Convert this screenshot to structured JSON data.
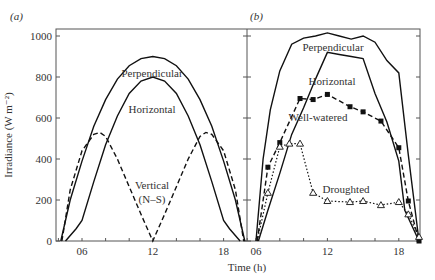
{
  "figure": {
    "ylabel": "Irradiance (W m⁻²)",
    "xlabel": "Time (h)",
    "yticks": [
      "0",
      "200",
      "400",
      "600",
      "800",
      "1000"
    ],
    "xticks": [
      "06",
      "12",
      "18"
    ]
  },
  "panels": [
    {
      "label": "(a)"
    },
    {
      "label": "(b)"
    }
  ],
  "annotations": {
    "a_perpendicular": "Perpendicular",
    "a_horizontal": "Horizontal",
    "a_vertical_1": "Vertical",
    "a_vertical_2": "(N–S)",
    "b_perpendicular": "Perpendicular",
    "b_horizontal": "Horizontal",
    "b_wellwatered": "Well-watered",
    "b_droughted": "Droughted"
  },
  "chart_data": [
    {
      "type": "line",
      "panel": "(a)",
      "title": "",
      "xlabel": "Time (h)",
      "ylabel": "Irradiance (W m-2)",
      "xlim": [
        3.8,
        20.1
      ],
      "ylim": [
        0,
        1000
      ],
      "xticks": [
        6,
        12,
        18
      ],
      "yticks": [
        0,
        200,
        400,
        600,
        800,
        1000
      ],
      "grid": false,
      "series": [
        {
          "name": "Perpendicular",
          "style": "solid",
          "x": [
            4.2,
            5,
            6,
            7,
            8,
            9,
            10,
            11,
            12,
            13,
            14,
            15,
            16,
            17,
            18,
            19,
            19.8
          ],
          "values": [
            0,
            200,
            390,
            560,
            690,
            790,
            855,
            890,
            900,
            890,
            855,
            790,
            690,
            560,
            390,
            200,
            0
          ]
        },
        {
          "name": "Horizontal",
          "style": "solid",
          "x": [
            4.6,
            5.5,
            6,
            7,
            8,
            9,
            10,
            11,
            12,
            13,
            14,
            15,
            16,
            17,
            18,
            18.5,
            19.4
          ],
          "values": [
            0,
            60,
            100,
            290,
            470,
            610,
            720,
            780,
            800,
            780,
            720,
            610,
            470,
            290,
            100,
            60,
            0
          ]
        },
        {
          "name": "Vertical (N-S)",
          "style": "dashed",
          "x": [
            4.3,
            5,
            6,
            7,
            7.5,
            8,
            9,
            10,
            11,
            12,
            13,
            14,
            15,
            16,
            16.5,
            17,
            18,
            19,
            19.7
          ],
          "values": [
            0,
            250,
            440,
            520,
            530,
            510,
            400,
            265,
            130,
            0,
            130,
            265,
            400,
            510,
            530,
            520,
            440,
            250,
            0
          ]
        }
      ]
    },
    {
      "type": "line",
      "panel": "(b)",
      "title": "",
      "xlabel": "Time (h)",
      "ylabel": "Irradiance (W m-2)",
      "xlim": [
        5.1,
        19.8
      ],
      "ylim": [
        0,
        1000
      ],
      "xticks": [
        6,
        12,
        18
      ],
      "yticks": [
        0,
        200,
        400,
        600,
        800,
        1000
      ],
      "grid": false,
      "series": [
        {
          "name": "Perpendicular",
          "style": "solid",
          "x": [
            6.0,
            6.6,
            7.2,
            8,
            9,
            10,
            11,
            12,
            13,
            14,
            15,
            16,
            17,
            18,
            18.8,
            19.7
          ],
          "values": [
            0,
            400,
            640,
            830,
            960,
            990,
            1000,
            1015,
            1000,
            985,
            1000,
            970,
            880,
            820,
            420,
            0
          ]
        },
        {
          "name": "Horizontal",
          "style": "solid",
          "x": [
            6.2,
            7,
            8,
            9,
            10,
            11,
            12,
            13,
            14,
            15,
            16,
            17,
            18,
            18.5,
            19.7
          ],
          "values": [
            0,
            150,
            330,
            520,
            650,
            790,
            920,
            910,
            900,
            890,
            720,
            580,
            390,
            150,
            0
          ]
        },
        {
          "name": "Well-watered",
          "style": "dashed",
          "marker": "filled-square",
          "x": [
            6.1,
            7,
            8,
            9.7,
            10.8,
            12,
            13.9,
            15,
            16.5,
            18,
            18.8,
            19.7
          ],
          "values": [
            0,
            360,
            480,
            695,
            690,
            715,
            655,
            630,
            585,
            455,
            195,
            0
          ]
        },
        {
          "name": "Droughted",
          "style": "dotted",
          "marker": "open-triangle",
          "x": [
            6.1,
            7,
            8,
            8.8,
            9.7,
            10.8,
            12,
            13.9,
            15,
            16.5,
            18,
            18.8,
            19.7
          ],
          "values": [
            0,
            235,
            460,
            475,
            475,
            235,
            195,
            190,
            195,
            175,
            190,
            130,
            20
          ]
        }
      ]
    }
  ]
}
